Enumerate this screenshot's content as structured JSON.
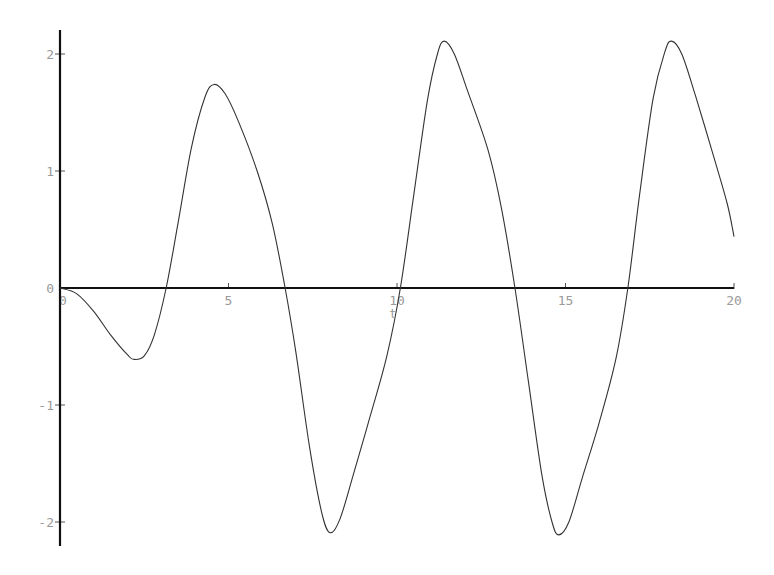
{
  "chart_data": {
    "type": "line",
    "title": "",
    "xlabel": "t",
    "ylabel": "",
    "xlim": [
      0,
      20
    ],
    "ylim": [
      -2.2,
      2.2
    ],
    "grid": false,
    "legend": null,
    "x_ticks": [
      0,
      5,
      10,
      15,
      20
    ],
    "x_tick_labels": [
      "0",
      "5",
      "10",
      "15",
      "20"
    ],
    "y_ticks": [
      -2,
      -1,
      0,
      1,
      2
    ],
    "y_tick_labels": [
      "-2",
      "-1",
      "0",
      "1",
      "2"
    ],
    "line_color": "#333333",
    "series": [
      {
        "name": "solution",
        "x": [
          0,
          0.5,
          1.0,
          1.5,
          2.0,
          2.2,
          2.5,
          2.8,
          3.15,
          3.5,
          3.9,
          4.3,
          4.57,
          4.9,
          5.3,
          5.85,
          6.3,
          6.68,
          7.0,
          7.4,
          7.75,
          8.0,
          8.3,
          8.7,
          9.2,
          9.7,
          10.1,
          10.5,
          10.9,
          11.2,
          11.4,
          11.7,
          12.1,
          12.7,
          13.1,
          13.5,
          13.9,
          14.3,
          14.6,
          14.8,
          15.1,
          15.5,
          16.0,
          16.5,
          16.85,
          17.2,
          17.6,
          17.95,
          18.15,
          18.45,
          18.85,
          19.4,
          19.8,
          20.0
        ],
        "y": [
          0,
          -0.05,
          -0.2,
          -0.4,
          -0.57,
          -0.61,
          -0.58,
          -0.4,
          0.0,
          0.55,
          1.2,
          1.63,
          1.74,
          1.66,
          1.42,
          1.0,
          0.55,
          0.0,
          -0.55,
          -1.35,
          -1.9,
          -2.09,
          -1.98,
          -1.6,
          -1.1,
          -0.58,
          0.0,
          0.8,
          1.6,
          2.0,
          2.11,
          2.0,
          1.68,
          1.18,
          0.68,
          0.0,
          -0.8,
          -1.6,
          -2.0,
          -2.11,
          -2.0,
          -1.62,
          -1.15,
          -0.6,
          0.0,
          0.8,
          1.62,
          2.02,
          2.11,
          2.0,
          1.65,
          1.12,
          0.72,
          0.44
        ]
      }
    ]
  }
}
